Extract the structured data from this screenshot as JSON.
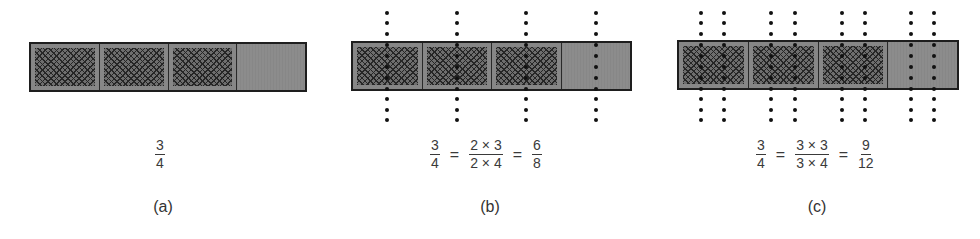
{
  "figure": {
    "colors": {
      "bar_border": "#1e1e1e",
      "bar_fill": "#8a8a8a",
      "hatch_lines": "#262626",
      "hatch_bg": "#6e6e6e",
      "dots": "#111111",
      "text": "#333333"
    },
    "panels": [
      {
        "id": "a",
        "caption": "(a)",
        "parts": 4,
        "shaded": 3,
        "subdivisions_per_part": 1,
        "equation": [
          {
            "num": "3",
            "den": "4"
          }
        ]
      },
      {
        "id": "b",
        "caption": "(b)",
        "parts": 4,
        "shaded": 3,
        "subdivisions_per_part": 2,
        "equation": [
          {
            "num": "3",
            "den": "4"
          },
          {
            "op": "="
          },
          {
            "num": "2 × 3",
            "den": "2 × 4"
          },
          {
            "op": "="
          },
          {
            "num": "6",
            "den": "8"
          }
        ]
      },
      {
        "id": "c",
        "caption": "(c)",
        "parts": 4,
        "shaded": 3,
        "subdivisions_per_part": 3,
        "equation": [
          {
            "num": "3",
            "den": "4"
          },
          {
            "op": "="
          },
          {
            "num": "3 × 3",
            "den": "3 × 4"
          },
          {
            "op": "="
          },
          {
            "num": "9",
            "den": "12"
          }
        ]
      }
    ]
  }
}
